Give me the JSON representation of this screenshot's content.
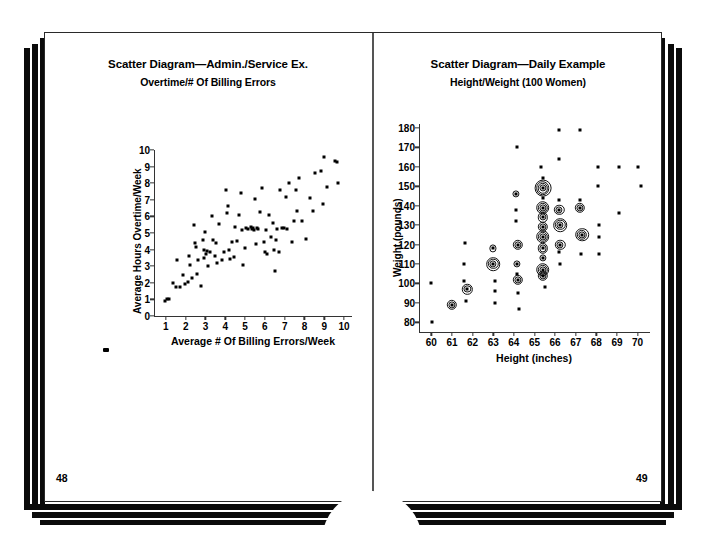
{
  "document": {
    "type": "book-spread",
    "left_page_number": "48",
    "right_page_number": "49"
  },
  "left_chart": {
    "title": "Scatter Diagram—Admin./Service Ex.",
    "subtitle": "Overtime/# Of Billing Errors",
    "xlabel": "Average # Of Billing Errors/Week",
    "ylabel": "Average Hours Overtime/Week",
    "xticks": [
      "1",
      "2",
      "3",
      "4",
      "5",
      "6",
      "7",
      "8",
      "9",
      "10"
    ],
    "yticks": [
      "0",
      "1",
      "2",
      "3",
      "4",
      "5",
      "6",
      "7",
      "8",
      "9",
      "10"
    ]
  },
  "right_chart": {
    "title": "Scatter Diagram—Daily Example",
    "subtitle": "Height/Weight (100 Women)",
    "xlabel": "Height (inches)",
    "ylabel": "Weight (pounds)",
    "xticks": [
      "60",
      "61",
      "62",
      "63",
      "64",
      "65",
      "66",
      "67",
      "68",
      "69",
      "70"
    ],
    "yticks": [
      "80",
      "90",
      "100",
      "110",
      "120",
      "130",
      "140",
      "150",
      "160",
      "170",
      "180"
    ]
  },
  "colors": {
    "ink": "#000000",
    "paper": "#ffffff",
    "edge": "#0b0b0b",
    "axis": "#333333"
  },
  "chart_data": [
    {
      "type": "scatter",
      "title": "Scatter Diagram—Admin./Service Ex.",
      "subtitle": "Overtime/# Of Billing Errors",
      "xlabel": "Average # Of Billing Errors/Week",
      "ylabel": "Average Hours Overtime/Week",
      "xlim": [
        0.4,
        10.4
      ],
      "ylim": [
        0,
        10
      ],
      "xticks": [
        1,
        2,
        3,
        4,
        5,
        6,
        7,
        8,
        9,
        10
      ],
      "yticks": [
        0,
        1,
        2,
        3,
        4,
        5,
        6,
        7,
        8,
        9,
        10
      ],
      "grid": false,
      "legend": "none",
      "points": [
        [
          0.95,
          0.9
        ],
        [
          1.05,
          1.0
        ],
        [
          1.15,
          1.05
        ],
        [
          1.35,
          2.0
        ],
        [
          1.5,
          1.75
        ],
        [
          1.55,
          3.4
        ],
        [
          1.7,
          1.75
        ],
        [
          1.85,
          2.5
        ],
        [
          1.95,
          1.95
        ],
        [
          2.1,
          2.05
        ],
        [
          2.15,
          3.6
        ],
        [
          2.2,
          3.05
        ],
        [
          2.3,
          2.3
        ],
        [
          2.4,
          5.5
        ],
        [
          2.45,
          4.4
        ],
        [
          2.5,
          4.15
        ],
        [
          2.55,
          2.55
        ],
        [
          2.6,
          3.4
        ],
        [
          2.75,
          1.8
        ],
        [
          2.85,
          4.6
        ],
        [
          2.9,
          3.95
        ],
        [
          2.95,
          3.5
        ],
        [
          3.0,
          5.05
        ],
        [
          3.05,
          3.75
        ],
        [
          3.1,
          3.9
        ],
        [
          3.15,
          3.0
        ],
        [
          3.25,
          3.85
        ],
        [
          3.35,
          6.0
        ],
        [
          3.4,
          4.55
        ],
        [
          3.5,
          3.6
        ],
        [
          3.55,
          4.4
        ],
        [
          3.6,
          3.2
        ],
        [
          3.7,
          5.55
        ],
        [
          3.85,
          3.35
        ],
        [
          3.95,
          3.85
        ],
        [
          4.05,
          7.6
        ],
        [
          4.1,
          6.2
        ],
        [
          4.15,
          6.6
        ],
        [
          4.2,
          4.0
        ],
        [
          4.25,
          3.45
        ],
        [
          4.35,
          4.45
        ],
        [
          4.45,
          3.55
        ],
        [
          4.5,
          5.35
        ],
        [
          4.6,
          4.5
        ],
        [
          4.7,
          6.1
        ],
        [
          4.8,
          7.4
        ],
        [
          4.85,
          5.2
        ],
        [
          4.9,
          3.1
        ],
        [
          5.0,
          4.1
        ],
        [
          5.05,
          5.3
        ],
        [
          5.15,
          5.25
        ],
        [
          5.3,
          5.35
        ],
        [
          5.35,
          5.25
        ],
        [
          5.4,
          5.3
        ],
        [
          5.45,
          5.2
        ],
        [
          5.5,
          7.05
        ],
        [
          5.55,
          4.35
        ],
        [
          5.6,
          5.3
        ],
        [
          5.65,
          5.25
        ],
        [
          5.75,
          6.25
        ],
        [
          5.85,
          7.7
        ],
        [
          5.95,
          4.45
        ],
        [
          6.0,
          3.85
        ],
        [
          6.05,
          5.2
        ],
        [
          6.1,
          3.75
        ],
        [
          6.2,
          6.1
        ],
        [
          6.3,
          4.75
        ],
        [
          6.4,
          5.6
        ],
        [
          6.45,
          4.0
        ],
        [
          6.5,
          2.7
        ],
        [
          6.55,
          4.6
        ],
        [
          6.6,
          5.25
        ],
        [
          6.7,
          3.85
        ],
        [
          6.75,
          7.6
        ],
        [
          6.85,
          5.3
        ],
        [
          6.95,
          5.3
        ],
        [
          7.05,
          7.15
        ],
        [
          7.1,
          5.25
        ],
        [
          7.2,
          8.0
        ],
        [
          7.35,
          4.45
        ],
        [
          7.45,
          5.7
        ],
        [
          7.55,
          7.6
        ],
        [
          7.6,
          6.3
        ],
        [
          7.7,
          8.3
        ],
        [
          7.85,
          5.75
        ],
        [
          8.1,
          4.65
        ],
        [
          8.3,
          7.1
        ],
        [
          8.45,
          6.3
        ],
        [
          8.55,
          8.6
        ],
        [
          8.85,
          8.75
        ],
        [
          8.95,
          6.75
        ],
        [
          9.0,
          9.55
        ],
        [
          9.15,
          7.8
        ],
        [
          9.55,
          9.35
        ],
        [
          9.65,
          9.3
        ],
        [
          9.7,
          8.0
        ]
      ]
    },
    {
      "type": "scatter",
      "title": "Scatter Diagram—Daily Example",
      "subtitle": "Height/Weight (100 Women)",
      "xlabel": "Height (inches)",
      "ylabel": "Weight (pounds)",
      "xlim": [
        59.4,
        70.6
      ],
      "ylim": [
        75,
        182
      ],
      "xticks": [
        60,
        61,
        62,
        63,
        64,
        65,
        66,
        67,
        68,
        69,
        70
      ],
      "yticks": [
        80,
        90,
        100,
        110,
        120,
        130,
        140,
        150,
        160,
        170,
        180
      ],
      "grid": false,
      "legend": "none",
      "marker_note": "concentric rings encode count of coincident observations",
      "points": [
        [
          60.0,
          100,
          1
        ],
        [
          60.05,
          80,
          1
        ],
        [
          61.0,
          89,
          3
        ],
        [
          61.65,
          121,
          1
        ],
        [
          61.6,
          110,
          1
        ],
        [
          61.6,
          101,
          1
        ],
        [
          61.75,
          97,
          3
        ],
        [
          61.7,
          91,
          1
        ],
        [
          63.0,
          118,
          2
        ],
        [
          63.0,
          110,
          4
        ],
        [
          63.1,
          101,
          1
        ],
        [
          63.1,
          96,
          1
        ],
        [
          63.1,
          90,
          1
        ],
        [
          64.15,
          170,
          1
        ],
        [
          64.1,
          146,
          2
        ],
        [
          64.1,
          138,
          1
        ],
        [
          64.1,
          132,
          1
        ],
        [
          64.2,
          120,
          3
        ],
        [
          64.15,
          110,
          2
        ],
        [
          64.15,
          105,
          1
        ],
        [
          64.2,
          102,
          3
        ],
        [
          64.2,
          95,
          1
        ],
        [
          64.25,
          87,
          1
        ],
        [
          65.3,
          160,
          1
        ],
        [
          65.4,
          154,
          1
        ],
        [
          65.4,
          149,
          5
        ],
        [
          65.4,
          144,
          1
        ],
        [
          65.4,
          139,
          4
        ],
        [
          65.4,
          134,
          3
        ],
        [
          65.4,
          129,
          3
        ],
        [
          65.4,
          124,
          4
        ],
        [
          65.4,
          118,
          3
        ],
        [
          65.4,
          113,
          2
        ],
        [
          65.4,
          107,
          4
        ],
        [
          65.4,
          104,
          3
        ],
        [
          65.5,
          98,
          1
        ],
        [
          66.2,
          179,
          1
        ],
        [
          66.2,
          164,
          1
        ],
        [
          66.2,
          143,
          1
        ],
        [
          66.2,
          138,
          3
        ],
        [
          66.25,
          130,
          4
        ],
        [
          66.25,
          120,
          3
        ],
        [
          66.2,
          116,
          1
        ],
        [
          66.25,
          110,
          1
        ],
        [
          67.2,
          179,
          1
        ],
        [
          67.2,
          143,
          1
        ],
        [
          67.2,
          139,
          3
        ],
        [
          67.3,
          125,
          4
        ],
        [
          67.25,
          115,
          1
        ],
        [
          68.1,
          160,
          1
        ],
        [
          68.1,
          150,
          1
        ],
        [
          68.15,
          130,
          1
        ],
        [
          68.15,
          124,
          1
        ],
        [
          68.15,
          115,
          1
        ],
        [
          69.1,
          160,
          1
        ],
        [
          69.1,
          136,
          1
        ],
        [
          70.0,
          160,
          1
        ],
        [
          70.15,
          150,
          1
        ]
      ]
    }
  ]
}
